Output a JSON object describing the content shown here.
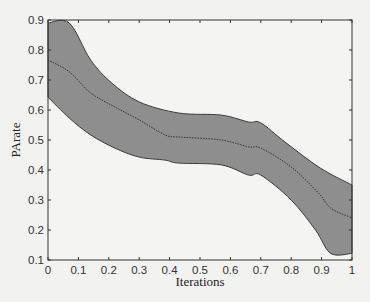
{
  "chart_data": {
    "type": "area",
    "title": "",
    "xlabel": "Iterations",
    "ylabel": "PArate",
    "xlim": [
      0,
      1
    ],
    "ylim": [
      0.1,
      0.9
    ],
    "xticks": [
      "0",
      "0.1",
      "0.2",
      "0.3",
      "0.4",
      "0.5",
      "0.6",
      "0.7",
      "0.8",
      "0.9",
      "1"
    ],
    "yticks": [
      "0.1",
      "0.2",
      "0.3",
      "0.4",
      "0.5",
      "0.6",
      "0.7",
      "0.8",
      "0.9"
    ],
    "grid": false,
    "legend": null,
    "colors": {
      "band_fill": "#8e8e8e",
      "band_edge": "#3a3a3a",
      "mean_line": "#333333",
      "axes": "#333333",
      "background": "#f2f2f0"
    },
    "series": [
      {
        "name": "upper bound",
        "x": [
          0,
          0.07,
          0.14,
          0.21,
          0.3,
          0.43,
          0.57,
          0.66,
          0.7,
          0.78,
          0.895,
          1.0
        ],
        "values": [
          0.89,
          0.89,
          0.767,
          0.69,
          0.627,
          0.59,
          0.583,
          0.56,
          0.557,
          0.493,
          0.407,
          0.35
        ]
      },
      {
        "name": "mean",
        "style": "dotted",
        "x": [
          0,
          0.07,
          0.14,
          0.22,
          0.3,
          0.385,
          0.43,
          0.57,
          0.66,
          0.7,
          0.8,
          0.89,
          0.93,
          1.0
        ],
        "values": [
          0.767,
          0.727,
          0.657,
          0.61,
          0.567,
          0.517,
          0.51,
          0.5,
          0.477,
          0.473,
          0.41,
          0.323,
          0.273,
          0.24
        ]
      },
      {
        "name": "lower bound",
        "x": [
          0,
          0.07,
          0.14,
          0.22,
          0.3,
          0.385,
          0.43,
          0.57,
          0.66,
          0.7,
          0.8,
          0.88,
          0.93,
          1.0
        ],
        "values": [
          0.643,
          0.573,
          0.517,
          0.473,
          0.443,
          0.433,
          0.423,
          0.417,
          0.383,
          0.383,
          0.3,
          0.2,
          0.122,
          0.122
        ]
      }
    ]
  }
}
